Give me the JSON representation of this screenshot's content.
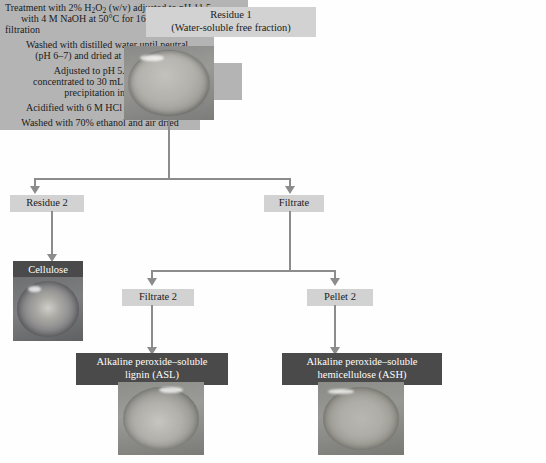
{
  "diagram": {
    "colors": {
      "light_box": "#d2d2d2",
      "dark_box": "#4a4a4a",
      "process_box": "#b4b4b4",
      "connector": "#8c8c8c",
      "background": "#fefefe"
    },
    "nodes": {
      "residue1": "Residue 1\n(Water-soluble free fraction)",
      "residue2": "Residue 2",
      "filtrate": "Filtrate",
      "cellulose": "Cellulose",
      "filtrate2": "Filtrate 2",
      "pellet2": "Pellet 2",
      "asl": "Alkaline peroxide–soluble\nlignin (ASL)",
      "ash": "Alkaline peroxide–soluble\nhemicellulose (ASH)"
    },
    "processes": {
      "peroxide_treatment_line1_pre": "Treatment with 2% H",
      "peroxide_treatment_line1_sub": "2",
      "peroxide_treatment_line1_mid": "O",
      "peroxide_treatment_line1_sub2": "2",
      "peroxide_treatment_line1_post": " (w/v) adjusted to pH 11.5",
      "peroxide_treatment_line2": "with 4 M NaOH at 50°C for 16 h with stirring",
      "peroxide_treatment_line3": "filtration",
      "wash_residue2_line1": "Washed with distilled water until neutral",
      "wash_residue2_line2": "(pH 6–7) and dried at 50°C for 48 h",
      "filtrate_line1": "Adjusted to pH 5.5 with 6 M HCl",
      "filtrate_line2": "concentrated to 30 mL on rotavapor at 40°C",
      "filtrate_line3": "precipitation in 95% ethanol",
      "acidify_filtrate2": "Acidified with 6 M HCl to pH 1.5",
      "wash_pellet2": "Washed with 70% ethanol and air dried"
    },
    "images": {
      "residue1_photo": "petri-dish-residue1-photo",
      "cellulose_photo": "petri-dish-cellulose-photo",
      "asl_photo": "petri-dish-asl-photo",
      "ash_photo": "petri-dish-ash-photo"
    }
  }
}
